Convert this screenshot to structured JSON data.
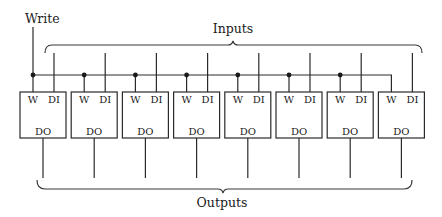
{
  "diagram": {
    "write_label": "Write",
    "inputs_label": "Inputs",
    "outputs_label": "Outputs",
    "cell_count": 8,
    "cells": [
      {
        "w": "W",
        "di": "DI",
        "do": "DO"
      },
      {
        "w": "W",
        "di": "DI",
        "do": "DO"
      },
      {
        "w": "W",
        "di": "DI",
        "do": "DO"
      },
      {
        "w": "W",
        "di": "DI",
        "do": "DO"
      },
      {
        "w": "W",
        "di": "DI",
        "do": "DO"
      },
      {
        "w": "W",
        "di": "DI",
        "do": "DO"
      },
      {
        "w": "W",
        "di": "DI",
        "do": "DO"
      },
      {
        "w": "W",
        "di": "DI",
        "do": "DO"
      }
    ]
  }
}
